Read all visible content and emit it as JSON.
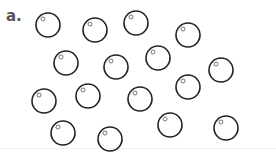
{
  "panel_label": "a.",
  "colors": {
    "stroke": "#222222",
    "inner_stroke": "#666666",
    "label": "#555555"
  },
  "circle_radius": 12,
  "inner_radius": 2,
  "circles": [
    {
      "cx": 48,
      "cy": 25
    },
    {
      "cx": 95,
      "cy": 30
    },
    {
      "cx": 136,
      "cy": 23
    },
    {
      "cx": 188,
      "cy": 35
    },
    {
      "cx": 66,
      "cy": 63
    },
    {
      "cx": 116,
      "cy": 67
    },
    {
      "cx": 158,
      "cy": 58
    },
    {
      "cx": 221,
      "cy": 70
    },
    {
      "cx": 44,
      "cy": 101
    },
    {
      "cx": 88,
      "cy": 96
    },
    {
      "cx": 140,
      "cy": 99
    },
    {
      "cx": 188,
      "cy": 87
    },
    {
      "cx": 63,
      "cy": 133
    },
    {
      "cx": 110,
      "cy": 139
    },
    {
      "cx": 170,
      "cy": 125
    },
    {
      "cx": 226,
      "cy": 128
    }
  ]
}
